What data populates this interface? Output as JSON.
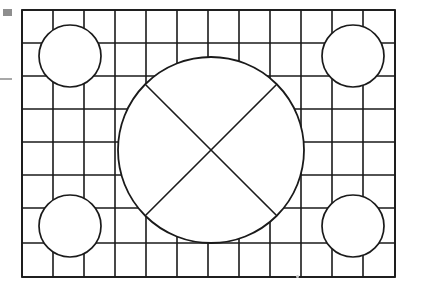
{
  "card": {
    "title": "Resolution Test Card",
    "description": "Monochrome grid test pattern with central circle, diagonal cross and four corner circles",
    "background_color": "#ffffff",
    "line_color": "#1a1a1a",
    "line_width": 1.6,
    "width": 422,
    "height": 287
  },
  "frame": {
    "name": "outer-border",
    "x": 22,
    "y": 10,
    "width": 373,
    "height": 267,
    "stroke": "#1a1a1a",
    "stroke_width": 1.8
  },
  "grid": {
    "columns": 12,
    "rows": 8,
    "column_x": [
      22,
      53,
      84,
      115,
      146,
      177,
      208,
      239,
      270,
      301,
      332,
      363,
      395
    ],
    "row_y": [
      10,
      43,
      76,
      109,
      142,
      175,
      208,
      243,
      277
    ],
    "stroke": "#1a1a1a",
    "stroke_width": 1.6,
    "note": "Grid lines are clipped where they enter any circle"
  },
  "center_circle": {
    "name": "center-circle",
    "cx": 211,
    "cy": 150,
    "r": 93,
    "stroke": "#1a1a1a",
    "stroke_width": 1.8,
    "fill": "#ffffff"
  },
  "cross": {
    "name": "diagonal-cross",
    "stroke": "#1a1a1a",
    "stroke_width": 1.6,
    "lines": [
      {
        "label": "diagonal-nw-se",
        "x1": 145.2,
        "y1": 84.2,
        "x2": 276.8,
        "y2": 215.8
      },
      {
        "label": "diagonal-ne-sw",
        "x1": 276.8,
        "y1": 84.2,
        "x2": 145.2,
        "y2": 215.8
      }
    ]
  },
  "corner_circles": [
    {
      "name": "corner-circle-top-left",
      "cx": 70,
      "cy": 56,
      "r": 31
    },
    {
      "name": "corner-circle-top-right",
      "cx": 353,
      "cy": 56,
      "r": 31
    },
    {
      "name": "corner-circle-bottom-left",
      "cx": 70,
      "cy": 226,
      "r": 31
    },
    {
      "name": "corner-circle-bottom-right",
      "cx": 353,
      "cy": 226,
      "r": 31
    }
  ],
  "artifacts": [
    {
      "name": "scan-artifact-square",
      "shape": "square",
      "color": "#8e8e8e"
    },
    {
      "name": "scan-artifact-dash",
      "shape": "dash",
      "color": "#a8a8a8"
    },
    {
      "name": "scan-artifact-speck",
      "shape": "dot",
      "color": "#c9c9c9"
    }
  ]
}
